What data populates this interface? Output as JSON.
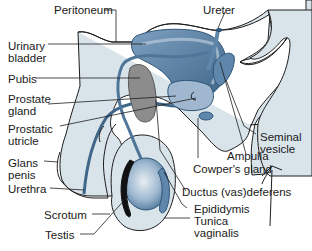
{
  "diagram": {
    "type": "anatomical-illustration",
    "colors": {
      "tissue_light": "#d9e3ea",
      "structure_blue": "#5f86ab",
      "structure_dark": "#2f5678",
      "bone_gray": "#8c8c8c",
      "outline": "#1e1e1e",
      "background": "#ffffff"
    },
    "labels": [
      {
        "id": "peritoneum",
        "text": "Peritoneum"
      },
      {
        "id": "ureter",
        "text": "Ureter"
      },
      {
        "id": "urinary-bladder",
        "text": "Urinary\nbladder"
      },
      {
        "id": "pubis",
        "text": "Pubis"
      },
      {
        "id": "prostate-gland",
        "text": "Prostate\ngland"
      },
      {
        "id": "prostatic-utricle",
        "text": "Prostatic\nutricle"
      },
      {
        "id": "glans-penis",
        "text": "Glans\npenis"
      },
      {
        "id": "urethra",
        "text": "Urethra"
      },
      {
        "id": "scrotum",
        "text": "Scrotum"
      },
      {
        "id": "testis",
        "text": "Testis"
      },
      {
        "id": "seminal-vesicle",
        "text": "Seminal\nvesicle"
      },
      {
        "id": "ampulla",
        "text": "Ampulla"
      },
      {
        "id": "cowpers-gland",
        "text": "Cowper's gland"
      },
      {
        "id": "ductus-deferens",
        "text": "Ductus (vas)deferens"
      },
      {
        "id": "epididymis",
        "text": "Epididymis"
      },
      {
        "id": "tunica-vaginalis",
        "text": "Tunica\nvaginalis"
      }
    ]
  }
}
